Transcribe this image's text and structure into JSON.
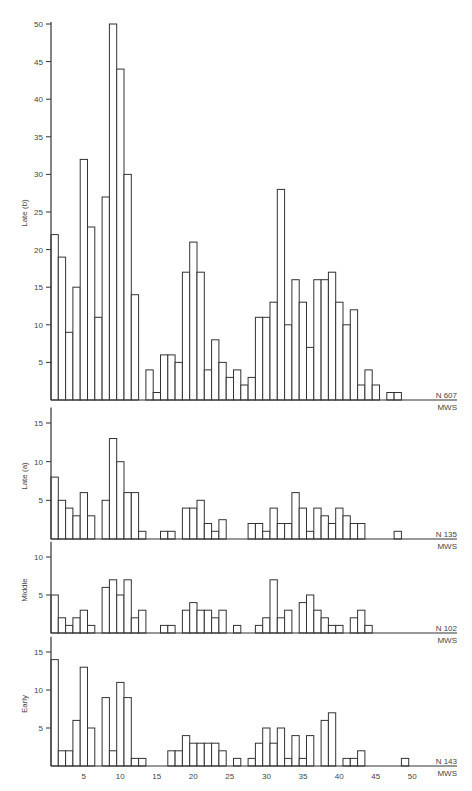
{
  "chart_data": [
    {
      "type": "bar",
      "panel": "Late (b)",
      "ylabel": "Late (b)",
      "xlabel": "MWS",
      "n_label": "N 607",
      "ylim": [
        0,
        50
      ],
      "yticks": [
        5,
        10,
        15,
        20,
        25,
        30,
        35,
        40,
        45,
        50
      ],
      "x": [
        1,
        2,
        3,
        4,
        5,
        6,
        7,
        8,
        9,
        10,
        11,
        12,
        13,
        14,
        15,
        16,
        17,
        18,
        19,
        20,
        21,
        22,
        23,
        24,
        25,
        26,
        27,
        28,
        29,
        30,
        31,
        32,
        33,
        34,
        35,
        36,
        37,
        38,
        39,
        40,
        41,
        42,
        43,
        44,
        45,
        46,
        47,
        48
      ],
      "values": [
        22,
        19,
        9,
        15,
        32,
        23,
        11,
        27,
        50,
        44,
        30,
        14,
        0,
        4,
        1,
        6,
        6,
        5,
        17,
        21,
        17,
        4,
        8,
        5,
        3,
        4,
        2,
        3,
        11,
        11,
        13,
        28,
        10,
        16,
        13,
        7,
        16,
        16,
        17,
        13,
        10,
        12,
        2,
        4,
        2,
        0,
        1,
        1
      ]
    },
    {
      "type": "bar",
      "panel": "Late (a)",
      "ylabel": "Late (a)",
      "xlabel": "MWS",
      "n_label": "N 135",
      "ylim": [
        0,
        15
      ],
      "yticks": [
        5,
        10,
        15
      ],
      "x": [
        1,
        2,
        3,
        4,
        5,
        6,
        7,
        8,
        9,
        10,
        11,
        12,
        13,
        14,
        15,
        16,
        17,
        18,
        19,
        20,
        21,
        22,
        23,
        24,
        25,
        26,
        27,
        28,
        29,
        30,
        31,
        32,
        33,
        34,
        35,
        36,
        37,
        38,
        39,
        40,
        41,
        42,
        43,
        44,
        45,
        46,
        47,
        48
      ],
      "values": [
        8,
        5,
        4,
        3,
        6,
        3,
        0,
        5,
        13,
        10,
        6,
        6,
        1,
        0,
        0,
        1,
        1,
        0,
        4,
        4,
        5,
        2,
        1,
        2.5,
        0,
        0,
        0,
        2,
        2,
        1,
        4,
        2,
        2,
        6,
        4,
        1,
        4,
        3,
        2,
        4,
        3,
        2,
        2,
        0,
        0,
        0,
        0,
        1
      ]
    },
    {
      "type": "bar",
      "panel": "Middle",
      "ylabel": "Middle",
      "xlabel": "MWS",
      "n_label": "N 102",
      "ylim": [
        0,
        10
      ],
      "yticks": [
        5,
        10
      ],
      "x": [
        1,
        2,
        3,
        4,
        5,
        6,
        7,
        8,
        9,
        10,
        11,
        12,
        13,
        14,
        15,
        16,
        17,
        18,
        19,
        20,
        21,
        22,
        23,
        24,
        25,
        26,
        27,
        28,
        29,
        30,
        31,
        32,
        33,
        34,
        35,
        36,
        37,
        38,
        39,
        40,
        41,
        42,
        43,
        44
      ],
      "values": [
        5,
        2,
        1,
        2,
        3,
        1,
        0,
        6,
        7,
        5,
        7,
        2,
        3,
        0,
        0,
        1,
        1,
        0,
        3,
        4,
        3,
        3,
        2,
        3,
        0,
        1,
        0,
        0,
        1,
        2,
        7,
        2,
        3,
        0,
        4,
        5,
        3,
        2,
        1,
        1,
        0,
        2,
        3,
        1
      ]
    },
    {
      "type": "bar",
      "panel": "Early",
      "ylabel": "Early",
      "xlabel": "MWS",
      "n_label": "N 143",
      "ylim": [
        0,
        15
      ],
      "yticks": [
        5,
        10,
        15
      ],
      "xticks": [
        5,
        10,
        15,
        20,
        25,
        30,
        35,
        40,
        45,
        50
      ],
      "x": [
        1,
        2,
        3,
        4,
        5,
        6,
        7,
        8,
        9,
        10,
        11,
        12,
        13,
        14,
        15,
        16,
        17,
        18,
        19,
        20,
        21,
        22,
        23,
        24,
        25,
        26,
        27,
        28,
        29,
        30,
        31,
        32,
        33,
        34,
        35,
        36,
        37,
        38,
        39,
        40,
        41,
        42,
        43,
        44,
        45,
        46,
        47,
        48,
        49
      ],
      "values": [
        14,
        2,
        2,
        6,
        13,
        5,
        0,
        9,
        2,
        11,
        9,
        1,
        1,
        0,
        0,
        0,
        2,
        2,
        4,
        3,
        3,
        3,
        3,
        2,
        0,
        1,
        0,
        1,
        3,
        5,
        3,
        5,
        1,
        4,
        1,
        4,
        0,
        6,
        7,
        0,
        1,
        1,
        2,
        0,
        0,
        0,
        0,
        0,
        1
      ]
    }
  ],
  "layout": {
    "axis_x": 51,
    "px_per_mws": 7.3,
    "axis_right": 457,
    "panels": [
      {
        "baseline": 400,
        "top_value_y": 24,
        "top_value": 50
      },
      {
        "baseline": 539,
        "top_value_y": 423,
        "top_value": 15
      },
      {
        "baseline": 633,
        "top_value_y": 557,
        "top_value": 10
      },
      {
        "baseline": 766,
        "top_value_y": 652,
        "top_value": 15
      }
    ]
  }
}
